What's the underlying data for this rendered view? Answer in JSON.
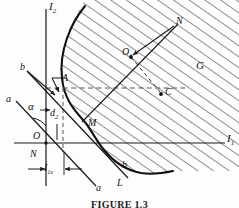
{
  "figure": {
    "caption": "FIGURE 1.3",
    "background": "#fdfdfd",
    "ink": "#1a1a1a",
    "hatch_color": "#2a2a2a"
  },
  "axes": {
    "x_label": "I",
    "x_sub": "1",
    "y_label": "I",
    "y_sub": "2",
    "origin_label": "O"
  },
  "points": [
    {
      "name": "point-a",
      "label": "A",
      "sub": ""
    },
    {
      "name": "point-m",
      "label": "M",
      "sub": ""
    },
    {
      "name": "point-o1",
      "label": "O",
      "sub": "1"
    },
    {
      "name": "point-c",
      "label": "C",
      "sub": ""
    },
    {
      "name": "point-n-origin",
      "label": "N",
      "sub": ""
    },
    {
      "name": "point-n-upper",
      "label": "N",
      "sub": ""
    }
  ],
  "lines": {
    "a_upper": "a",
    "a_lower": "a",
    "b_upper": "b",
    "b_lower": "b"
  },
  "regions": {
    "hatched_region": "G",
    "boundary_curve": "L"
  },
  "dimensions": {
    "angle": "α",
    "vertical_offset": "d",
    "vertical_offset_sub": "2",
    "horizontal_offset": "I",
    "horizontal_offset_sub": "1e"
  }
}
